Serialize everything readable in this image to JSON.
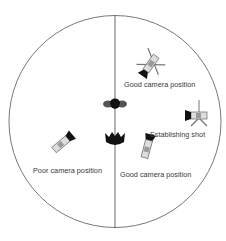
{
  "diagram": {
    "type": "camera-placement-180-rule",
    "line_color": "#4a4a4a",
    "subject_color": "#1a1a1a",
    "camera_color": "#888888",
    "subjects": [
      {
        "name": "subject-top",
        "icon": "person-topdown-icon"
      },
      {
        "name": "subject-bottom",
        "icon": "person-topdown-icon"
      }
    ],
    "cameras": [
      {
        "label": "Good camera position",
        "icon": "camera-tripod-icon"
      },
      {
        "label": "Establishing shot",
        "icon": "camera-tripod-icon"
      },
      {
        "label": "Good camera position",
        "icon": "camera-icon"
      },
      {
        "label": "Poor camera position",
        "icon": "camera-icon"
      }
    ]
  }
}
